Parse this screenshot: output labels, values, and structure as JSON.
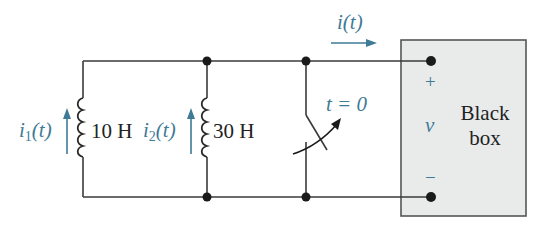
{
  "colors": {
    "wire": "#3a3a3a",
    "accent": "#3f7a96",
    "box_fill": "#e9ebeb",
    "box_stroke": "#555555",
    "text": "#222222"
  },
  "inductors": [
    {
      "id": "L1",
      "value": "10 H",
      "current_label": {
        "var": "i",
        "sub": "1",
        "arg": "(t)"
      },
      "current_direction": "up"
    },
    {
      "id": "L2",
      "value": "30 H",
      "current_label": {
        "var": "i",
        "sub": "2",
        "arg": "(t)"
      },
      "current_direction": "up"
    }
  ],
  "switch": {
    "label": "t = 0",
    "action": "opens at t = 0"
  },
  "output_current": {
    "label": "i(t)",
    "direction": "right"
  },
  "black_box": {
    "line1": "Black",
    "line2": "box",
    "voltage_label": "v",
    "plus": "+",
    "minus": "−"
  }
}
